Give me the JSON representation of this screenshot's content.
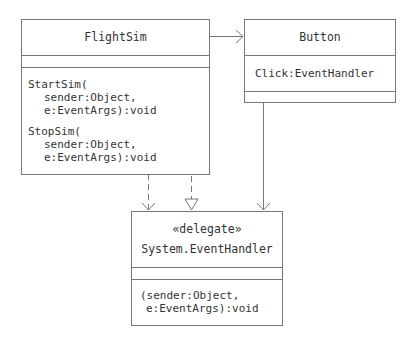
{
  "diagram": {
    "type": "UML class diagram",
    "classes": {
      "flightsim": {
        "name": "FlightSim",
        "attributes": [],
        "operations": [
          {
            "line1": "StartSim(",
            "line2": "sender:Object,",
            "line3": "e:EventArgs):void"
          },
          {
            "line1": "StopSim(",
            "line2": "sender:Object,",
            "line3": "e:EventArgs):void"
          }
        ]
      },
      "button": {
        "name": "Button",
        "attributes": [
          "Click:EventHandler"
        ],
        "operations": []
      },
      "eventhandler": {
        "stereotype": "«delegate»",
        "name": "System.EventHandler",
        "attributes": [],
        "operations": [
          {
            "line1": "(sender:Object,",
            "line2": "e:EventArgs):void"
          }
        ]
      }
    },
    "relationships": [
      {
        "from": "FlightSim",
        "to": "Button",
        "kind": "association",
        "style": "solid-open-arrow"
      },
      {
        "from": "FlightSim",
        "to": "System.EventHandler",
        "kind": "dependency",
        "style": "dashed-open-arrow"
      },
      {
        "from": "FlightSim.StartSim/StopSim",
        "to": "System.EventHandler",
        "kind": "realization",
        "style": "dashed-hollow-triangle"
      },
      {
        "from": "Button",
        "to": "System.EventHandler",
        "kind": "association",
        "style": "solid-open-arrow"
      }
    ],
    "colors": {
      "line": "#777777",
      "text": "#333333",
      "background": "#ffffff"
    }
  }
}
